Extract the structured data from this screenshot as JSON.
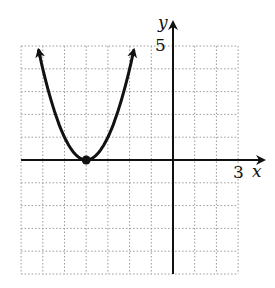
{
  "chart_data": {
    "type": "line",
    "title": "",
    "function": "y = (x + 4)^2",
    "series": [
      {
        "name": "parabola",
        "x": [
          -6.2,
          -6,
          -5.5,
          -5,
          -4.5,
          -4,
          -3.5,
          -3,
          -2.5,
          -2,
          -1.8
        ],
        "y": [
          4.84,
          4,
          2.25,
          1,
          0.25,
          0,
          0.25,
          1,
          2.25,
          4,
          4.84
        ],
        "arrows_both_ends": true
      }
    ],
    "points": [
      {
        "x": -4,
        "y": 0,
        "label": "vertex"
      }
    ],
    "xlabel": "x",
    "ylabel": "y",
    "x_tick_label": {
      "value": 3,
      "text": "3"
    },
    "y_tick_label": {
      "value": 5,
      "text": "5"
    },
    "xlim": [
      -7,
      3
    ],
    "ylim": [
      -5,
      5
    ],
    "grid": true,
    "grid_style": "dotted",
    "legend": null
  },
  "labels": {
    "x_axis": "x",
    "y_axis": "y",
    "x_tick": "3",
    "y_tick": "5"
  },
  "colors": {
    "curve": "#111111",
    "axis": "#111111",
    "grid": "#9a9a9a"
  }
}
